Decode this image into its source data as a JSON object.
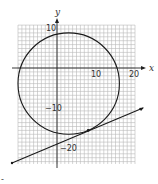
{
  "chart_data": {
    "type": "diagram",
    "title": "",
    "xlabel": "x",
    "ylabel": "y",
    "xlim": [
      -10,
      20
    ],
    "ylim": [
      -25,
      11
    ],
    "grid": true,
    "grid_step": 1,
    "x_tick_labels": [
      "10",
      "20"
    ],
    "y_tick_labels": [
      "10",
      "−10",
      "−20"
    ],
    "circle": {
      "center": [
        3,
        -4
      ],
      "radius": 13
    },
    "tangent_point": [
      8,
      -16
    ],
    "tangent_line": {
      "slope": 0.4167,
      "from": [
        -12,
        -24.3
      ],
      "to": [
        22,
        -10.2
      ]
    }
  },
  "figure": {
    "x_axis_label": "x",
    "y_axis_label": "y",
    "x_tick_10": "10",
    "x_tick_20": "20",
    "y_tick_10": "10",
    "y_tick_neg10": "−10",
    "y_tick_neg20": "−20",
    "stray_mark": "-"
  }
}
